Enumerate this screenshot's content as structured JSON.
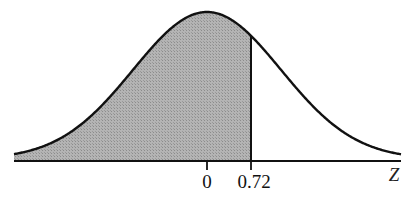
{
  "figure": {
    "axis_label": "Z",
    "tick_labels": [
      "0",
      "0.72"
    ],
    "shaded_region": "left of 0.72",
    "colors": {
      "curve": "#111111",
      "shade": "#a9a9a9",
      "axis": "#111111",
      "background": "#ffffff"
    }
  },
  "chart_data": {
    "type": "area",
    "title": "",
    "xlabel": "Z",
    "ylabel": "",
    "distribution": "standard normal",
    "mean": 0,
    "marked_z": 0.72,
    "x_ticks": [
      0,
      0.72
    ],
    "shaded": {
      "from": "-inf",
      "to": 0.72
    },
    "grid": false
  }
}
